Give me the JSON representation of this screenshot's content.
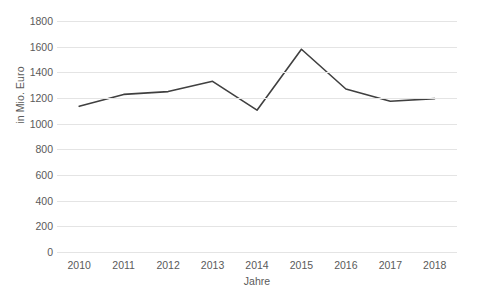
{
  "chart_data": {
    "type": "line",
    "title": "",
    "subtitle": "",
    "xlabel": "Jahre",
    "ylabel": "in Mio. Euro",
    "categories": [
      "2010",
      "2011",
      "2012",
      "2013",
      "2014",
      "2015",
      "2016",
      "2017",
      "2018"
    ],
    "values": [
      1135,
      1228,
      1250,
      1330,
      1105,
      1580,
      1270,
      1175,
      1195
    ],
    "series": [
      {
        "name": "in Mio. Euro",
        "values": [
          1135,
          1228,
          1250,
          1330,
          1105,
          1580,
          1270,
          1175,
          1195
        ]
      }
    ],
    "ylim": [
      0,
      1800
    ],
    "yticks": [
      0,
      200,
      400,
      600,
      800,
      1000,
      1200,
      1400,
      1600,
      1800
    ],
    "ytick_labels": [
      "0",
      "200",
      "400",
      "600",
      "800",
      "1000",
      "1200",
      "1400",
      "1600",
      "1800"
    ],
    "grid": "horizontal",
    "legend": "none",
    "line_color": "#404040",
    "grid_color": "#e4e4e4",
    "text_color": "#5a5a5a",
    "background": "#ffffff",
    "markers": false,
    "annotations": []
  }
}
